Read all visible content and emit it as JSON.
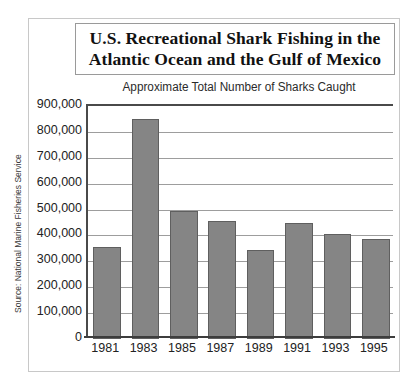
{
  "chart_data": {
    "type": "bar",
    "title": "U.S. Recreational Shark Fishing in the Atlantic Ocean and the Gulf of Mexico",
    "title_lines": [
      "U.S. Recreational Shark Fishing in the",
      "Atlantic Ocean and the Gulf of Mexico"
    ],
    "subtitle": "Approximate Total Number of Sharks Caught",
    "categories": [
      "1981",
      "1983",
      "1985",
      "1987",
      "1989",
      "1991",
      "1993",
      "1995"
    ],
    "values": [
      355000,
      850000,
      495000,
      455000,
      345000,
      450000,
      405000,
      385000
    ],
    "xlabel": "",
    "ylabel": "",
    "ylim": [
      0,
      900000
    ],
    "ytick_values": [
      0,
      100000,
      200000,
      300000,
      400000,
      500000,
      600000,
      700000,
      800000,
      900000
    ],
    "ytick_labels": [
      "0",
      "100,000",
      "200,000",
      "300,000",
      "400,000",
      "500,000",
      "600,000",
      "700,000",
      "800,000",
      "900,000"
    ],
    "grid": true,
    "legend": null,
    "source_note": "Source: National Marine Fisheries Service",
    "colors": {
      "bar_fill": "#858585",
      "bar_stroke": "#5f5f5f",
      "gridline": "#9d9d9d",
      "axis": "#3d3d3d",
      "text": "#222222",
      "frame": "#c8c8c8",
      "title_border": "#9a9a9a",
      "background": "#ffffff"
    }
  }
}
